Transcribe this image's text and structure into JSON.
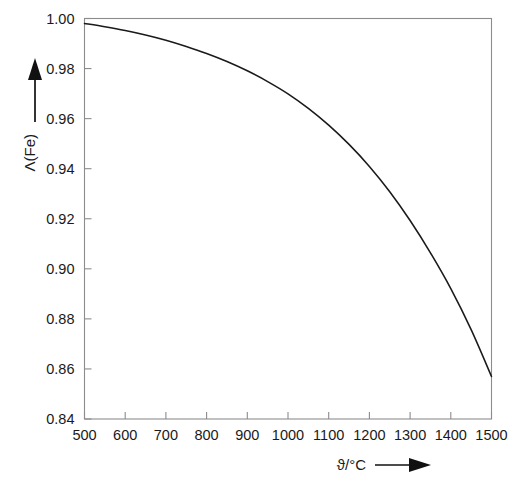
{
  "chart_data": {
    "type": "line",
    "title": "",
    "subtitle": "",
    "xlabel": "ϑ/°C",
    "ylabel": "Λ(Fe)",
    "xlim": [
      500,
      1500
    ],
    "ylim": [
      0.84,
      1.0
    ],
    "grid": false,
    "legend": null,
    "x_ticks": [
      500,
      600,
      700,
      800,
      900,
      1000,
      1100,
      1200,
      1300,
      1400,
      1500
    ],
    "x_tick_labels": [
      "500",
      "600",
      "700",
      "800",
      "900",
      "1000",
      "1100",
      "1200",
      "1300",
      "1400",
      "1500"
    ],
    "y_ticks": [
      0.84,
      0.86,
      0.88,
      0.9,
      0.92,
      0.94,
      0.96,
      0.98,
      1.0
    ],
    "y_tick_labels": [
      "0.84",
      "0.86",
      "0.88",
      "0.90",
      "0.92",
      "0.94",
      "0.96",
      "0.98",
      "1.00"
    ],
    "series": [
      {
        "name": "Λ(Fe)",
        "color": "#1a1a1a",
        "x": [
          500,
          550,
          600,
          650,
          700,
          750,
          800,
          850,
          900,
          950,
          1000,
          1050,
          1100,
          1150,
          1200,
          1250,
          1300,
          1350,
          1400,
          1450,
          1500
        ],
        "values": [
          0.998,
          0.9967,
          0.9952,
          0.9934,
          0.9913,
          0.9888,
          0.986,
          0.9828,
          0.9791,
          0.9748,
          0.9699,
          0.9641,
          0.9574,
          0.9497,
          0.9409,
          0.9308,
          0.9193,
          0.9064,
          0.8921,
          0.8757,
          0.857
        ]
      }
    ],
    "annotations": {
      "x_axis_arrow": "right-arrow",
      "y_axis_arrow": "up-arrow"
    },
    "colors": {
      "curve": "#1a1a1a",
      "frame": "#8c8c8c",
      "text": "#1a1a1a",
      "background": "#ffffff"
    }
  }
}
